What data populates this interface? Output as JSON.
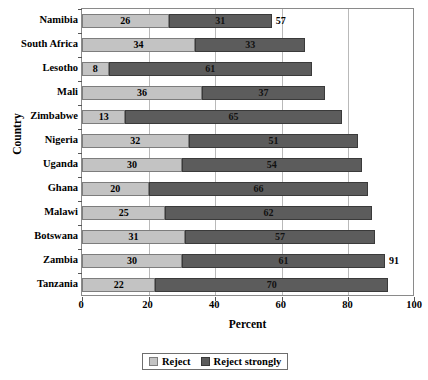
{
  "chart_data": {
    "type": "bar",
    "orientation": "horizontal",
    "stacked": true,
    "title": "",
    "xlabel": "Percent",
    "ylabel": "Country",
    "xlim": [
      0,
      100
    ],
    "xticks": [
      0,
      20,
      40,
      60,
      80,
      100
    ],
    "grid": true,
    "legend_position": "bottom-center",
    "categories": [
      "Namibia",
      "South Africa",
      "Lesotho",
      "Mali",
      "Zimbabwe",
      "Nigeria",
      "Uganda",
      "Ghana",
      "Malawi",
      "Botswana",
      "Zambia",
      "Tanzania"
    ],
    "series": [
      {
        "name": "Reject",
        "color": "#c3c3c3",
        "values": [
          26,
          34,
          8,
          36,
          13,
          32,
          30,
          20,
          25,
          31,
          30,
          22
        ]
      },
      {
        "name": "Reject strongly",
        "color": "#5c5c5c",
        "values": [
          31,
          33,
          61,
          37,
          65,
          51,
          54,
          66,
          62,
          57,
          61,
          70
        ]
      }
    ],
    "totals": [
      57,
      67,
      69,
      73,
      78,
      83,
      84,
      86,
      87,
      88,
      91,
      92
    ],
    "total_labels_shown": [
      57,
      null,
      null,
      null,
      null,
      null,
      null,
      null,
      null,
      null,
      91,
      null
    ],
    "annotations": [
      {
        "category": "Namibia",
        "text": "57",
        "position": "outside-end"
      },
      {
        "category": "Zambia",
        "text": "91",
        "position": "outside-end"
      }
    ]
  },
  "axes": {
    "x_title": "Percent",
    "y_title": "Country",
    "x_tick_labels": [
      "0",
      "20",
      "40",
      "60",
      "80",
      "100"
    ]
  },
  "legend": {
    "items": [
      {
        "label": "Reject",
        "swatch": "light-gray-swatch"
      },
      {
        "label": "Reject strongly",
        "swatch": "dark-gray-swatch"
      }
    ]
  }
}
